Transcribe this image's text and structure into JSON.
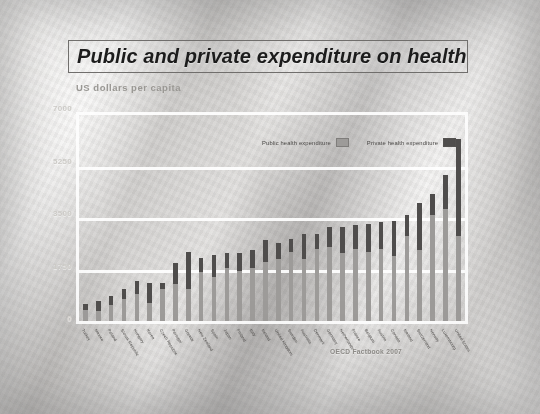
{
  "slide": {
    "title": "Public and private expenditure on health",
    "subtitle": "US dollars per capita",
    "source": "OECD Factbook 2007"
  },
  "legend": {
    "items": [
      {
        "label": "Public health expenditure",
        "color": "#9d9b99",
        "icon": "legend-swatch-public"
      },
      {
        "label": "Private health expenditure",
        "color": "#4f4d4c",
        "icon": "legend-swatch-private"
      }
    ]
  },
  "chart_data": {
    "type": "bar",
    "subtype": "stacked",
    "title": "Public and private expenditure on health",
    "subtitle": "US dollars per capita",
    "xlabel": "",
    "ylabel": "US dollars per capita",
    "ylim": [
      0,
      7000
    ],
    "yticks": [
      0,
      1750,
      3500,
      5250,
      7000
    ],
    "ytick_labels": [
      "0",
      "1750",
      "3500",
      "5250",
      "7000"
    ],
    "grid": true,
    "legend_position": "top-center",
    "source": "OECD Factbook 2007",
    "categories": [
      "Turkey",
      "Mexico",
      "Poland",
      "Slovak Republic",
      "Hungary",
      "Korea",
      "Czech Republic",
      "Portugal",
      "Greece",
      "New Zealand",
      "Spain",
      "Japan",
      "Finland",
      "Italy",
      "Ireland",
      "United Kingdom",
      "Sweden",
      "Australia",
      "Denmark",
      "Germany",
      "Netherlands",
      "France",
      "Belgium",
      "Austria",
      "Canada",
      "Iceland",
      "Switzerland",
      "Norway",
      "Luxembourg",
      "United States"
    ],
    "series": [
      {
        "name": "Public health expenditure",
        "color": "#9d9b99",
        "values": [
          380,
          330,
          540,
          760,
          910,
          620,
          1100,
          1250,
          1100,
          1650,
          1500,
          1800,
          1700,
          1800,
          2000,
          2100,
          2350,
          2100,
          2450,
          2500,
          2300,
          2450,
          2350,
          2450,
          2200,
          2900,
          2400,
          3600,
          3800,
          2900
        ]
      },
      {
        "name": "Private health expenditure",
        "color": "#4f4d4c",
        "values": [
          200,
          350,
          300,
          340,
          460,
          680,
          200,
          720,
          1250,
          500,
          760,
          500,
          600,
          620,
          750,
          550,
          450,
          870,
          500,
          700,
          900,
          800,
          950,
          900,
          1200,
          700,
          1600,
          700,
          1150,
          3300
        ]
      }
    ],
    "totals": [
      580,
      680,
      840,
      1100,
      1370,
      1300,
      1300,
      1970,
      2350,
      2150,
      2260,
      2300,
      2300,
      2420,
      2750,
      2650,
      2800,
      2970,
      2950,
      3200,
      3200,
      3250,
      3300,
      3350,
      3400,
      3600,
      4000,
      4300,
      4950,
      6200
    ]
  }
}
